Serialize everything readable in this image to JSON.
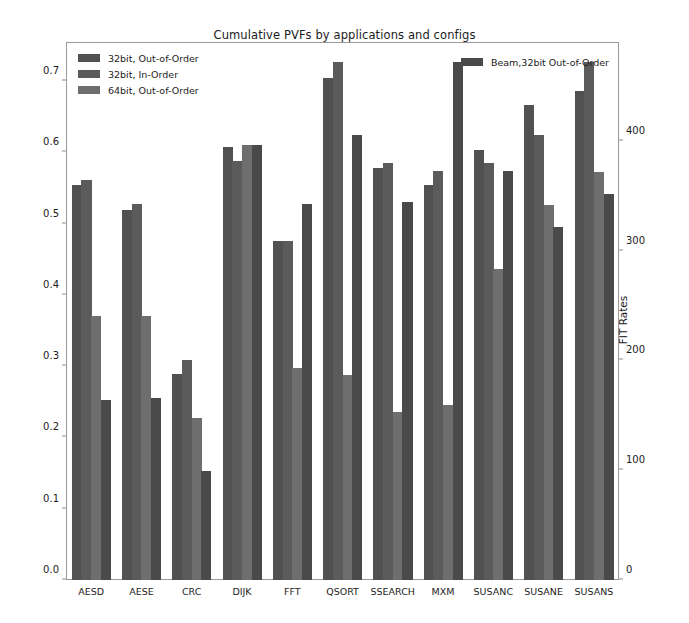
{
  "chart_data": {
    "type": "bar",
    "title": "Cumulative PVFs by applications and configs",
    "xlabel": "",
    "ylabel": "CumulativePVF",
    "y2label": "FIT Rates",
    "ylim": [
      0.0,
      0.755
    ],
    "y2lim": [
      0,
      490
    ],
    "yticks": [
      "0.0",
      "0.1",
      "0.2",
      "0.3",
      "0.4",
      "0.5",
      "0.6",
      "0.7"
    ],
    "ytick_values": [
      0.0,
      0.1,
      0.2,
      0.3,
      0.4,
      0.5,
      0.6,
      0.7
    ],
    "y2ticks": [
      "0",
      "100",
      "200",
      "300",
      "400"
    ],
    "y2tick_values": [
      0,
      100,
      200,
      300,
      400
    ],
    "grid": false,
    "legend_position": "upper-left and upper-right inside axes",
    "categories": [
      "AESD",
      "AESE",
      "CRC",
      "DIJK",
      "FFT",
      "QSORT",
      "SSEARCH",
      "MXM",
      "SUSANC",
      "SUSANE",
      "SUSANS"
    ],
    "series": [
      {
        "name": "32bit, Out-of-Order",
        "color": "#515151",
        "values": [
          0.555,
          0.519,
          0.289,
          0.607,
          0.476,
          0.705,
          0.578,
          0.555,
          0.604,
          0.666,
          0.686
        ]
      },
      {
        "name": "32bit, In-Order",
        "color": "#5b5b5b",
        "values": [
          0.562,
          0.527,
          0.309,
          0.588,
          0.476,
          0.727,
          0.585,
          0.574,
          0.585,
          0.624,
          0.727
        ]
      },
      {
        "name": "64bit, Out-of-Order",
        "color": "#6e6e6e",
        "values": [
          0.37,
          0.37,
          0.228,
          0.61,
          0.297,
          0.288,
          0.236,
          0.245,
          0.437,
          0.526,
          0.573
        ]
      },
      {
        "name": "Beam,32bit Out-of-Order",
        "color": "#4a4a4a",
        "values": [
          0.253,
          0.256,
          0.153,
          0.61,
          0.527,
          0.625,
          0.531,
          0.727,
          0.574,
          0.496,
          0.542
        ]
      }
    ]
  },
  "legend_left": {
    "entries": [
      {
        "label": "32bit, Out-of-Order"
      },
      {
        "label": "32bit, In-Order"
      },
      {
        "label": "64bit, Out-of-Order"
      }
    ]
  },
  "legend_right": {
    "entries": [
      {
        "label": "Beam,32bit Out-of-Order"
      }
    ]
  }
}
